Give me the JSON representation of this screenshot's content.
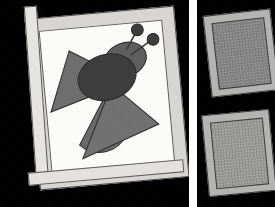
{
  "scene": {
    "title": "Framed bee appliqué quilt with two smaller framed panels",
    "background_color": "#000000",
    "divider_color": "#ffffff",
    "panel_count": 3
  },
  "left_panel": {
    "name": "Bee appliqué quilt block in wooden frame",
    "frame_color": "#d7d6d2",
    "frame_border_color": "#4a4a4a",
    "mat_color": "#fbfbfa",
    "rotation_degrees": -5.2,
    "subject": "bee",
    "shapes": [
      {
        "id": "left-wing",
        "type": "triangle",
        "color": "#6e6e6e",
        "label": "Left wing"
      },
      {
        "id": "lower-left-wing",
        "type": "half-circle",
        "color": "#6a6a6a",
        "label": "Lower left wing"
      },
      {
        "id": "lower-right-wing",
        "type": "triangle",
        "color": "#717171",
        "label": "Lower right wing"
      },
      {
        "id": "body",
        "type": "ellipse",
        "color": "#3d3d3d",
        "label": "Bee body"
      },
      {
        "id": "head",
        "type": "ellipse",
        "color": "#5e5e5e",
        "label": "Bee head"
      },
      {
        "id": "antenna-left",
        "type": "line-with-dot",
        "color": "#3a3a3a",
        "label": "Left antenna"
      },
      {
        "id": "antenna-right",
        "type": "line-with-dot",
        "color": "#3a3a3a",
        "label": "Right antenna"
      }
    ]
  },
  "right_panels": [
    {
      "id": "right-top",
      "name": "Upper small framed panel",
      "frame_color": "#b4b4b2",
      "interior_color": "#868686",
      "rotation_degrees": -6.5,
      "texture": "woven grid"
    },
    {
      "id": "right-bottom",
      "name": "Lower small framed panel",
      "frame_color": "#b4b4b2",
      "interior_color": "#9a9a99",
      "rotation_degrees": -5.5,
      "texture": "woven grid"
    }
  ]
}
